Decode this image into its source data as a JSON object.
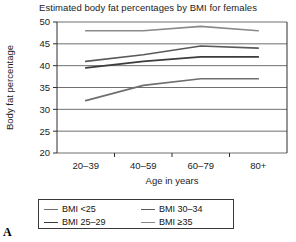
{
  "figure": {
    "panel_label": "A"
  },
  "chart_data": {
    "type": "line",
    "title": "Estimated body fat percentages by BMI for females",
    "xlabel": "Age in years",
    "ylabel": "Body fat percentage",
    "categories": [
      "20–39",
      "40–59",
      "60–79",
      "80+"
    ],
    "ylim": [
      20,
      50
    ],
    "yticks": [
      20,
      25,
      30,
      35,
      40,
      45,
      50
    ],
    "ytick_labels": [
      "20",
      "25",
      "30",
      "35",
      "40",
      "45",
      "50"
    ],
    "grid": true,
    "grid_axis": "y",
    "legend_position": "below-plot",
    "legend_columns": 2,
    "series": [
      {
        "name": "BMI <25",
        "color": "#6f6f6f",
        "values": [
          32.0,
          35.5,
          37.0,
          37.0
        ]
      },
      {
        "name": "BMI 25–29",
        "color": "#3c3c3c",
        "values": [
          39.5,
          41.0,
          42.0,
          42.0
        ]
      },
      {
        "name": "BMI 30–34",
        "color": "#5a5a5a",
        "values": [
          41.0,
          42.5,
          44.5,
          44.0
        ]
      },
      {
        "name": "BMI ≥35",
        "color": "#8a8a8a",
        "values": [
          48.0,
          48.0,
          49.0,
          48.0
        ]
      }
    ]
  },
  "legend": {
    "entries": [
      {
        "label": "BMI <25",
        "color": "#6f6f6f"
      },
      {
        "label": "BMI 25–29",
        "color": "#3c3c3c"
      },
      {
        "label": "BMI 30–34",
        "color": "#5a5a5a"
      },
      {
        "label": "BMI ≥35",
        "color": "#8a8a8a"
      }
    ]
  }
}
